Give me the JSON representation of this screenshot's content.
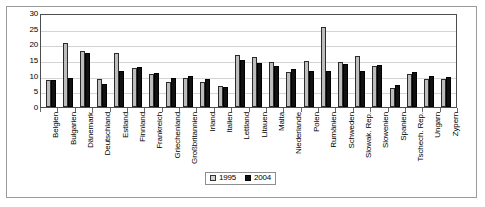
{
  "chart_data": {
    "type": "bar",
    "title": "",
    "subtitle": "",
    "xlabel": "",
    "ylabel": "",
    "ylim": [
      0,
      30
    ],
    "yticks": [
      0,
      5,
      10,
      15,
      20,
      25,
      30
    ],
    "grid": true,
    "legend_position": "bottom-center",
    "categories": [
      "Belgien",
      "Bulgarien",
      "Dänemark",
      "Deutschland",
      "Estland",
      "Finnland",
      "Frankreich",
      "Griechenland",
      "Großbritannien",
      "Irland",
      "Italien",
      "Lettland",
      "Litauen",
      "Malta",
      "Niederlande",
      "Polen",
      "Rumänien",
      "Schweden",
      "Slowak. Rep.",
      "Slowenien",
      "Spanien",
      "Tschech. Rep.",
      "Ungarn",
      "Zypern"
    ],
    "series": [
      {
        "name": "1995",
        "color": "#bdbdbd",
        "values": [
          8.7,
          20.5,
          18.0,
          8.8,
          17.2,
          12.4,
          10.5,
          8.1,
          9.4,
          8.0,
          6.7,
          16.5,
          16.0,
          14.5,
          11.3,
          14.7,
          25.5,
          14.3,
          16.3,
          13.0,
          6.2,
          10.5,
          9.0,
          9.0
        ]
      },
      {
        "name": "2004",
        "color": "#111111",
        "values": [
          8.7,
          9.4,
          17.2,
          7.2,
          11.4,
          12.8,
          11.0,
          9.2,
          10.0,
          9.0,
          6.5,
          15.0,
          14.0,
          13.0,
          12.1,
          11.5,
          11.5,
          13.8,
          11.5,
          13.4,
          7.0,
          11.3,
          9.8,
          9.7
        ]
      }
    ]
  },
  "legend": {
    "items": [
      {
        "label": "1995",
        "swatch": "light-gray-square-icon"
      },
      {
        "label": "2004",
        "swatch": "black-square-icon"
      }
    ]
  }
}
